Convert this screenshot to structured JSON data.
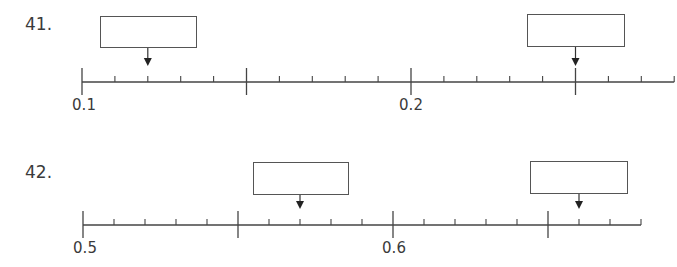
{
  "problems": [
    {
      "number": "41.",
      "line": {
        "start_value": 0.1,
        "end_value": 0.28,
        "minor_step": 0.01,
        "x_start": 82,
        "px_per_step": 32.9,
        "y": 82
      },
      "labels": [
        {
          "text": "0.1",
          "value": 0.1
        },
        {
          "text": "0.2",
          "value": 0.2
        }
      ],
      "answer_boxes": [
        {
          "points_to_value": 0.12,
          "value": ""
        },
        {
          "points_to_value": 0.25,
          "value": ""
        }
      ]
    },
    {
      "number": "42.",
      "line": {
        "start_value": 0.5,
        "end_value": 0.68,
        "minor_step": 0.01,
        "x_start": 83,
        "px_per_step": 31.0,
        "y": 225
      },
      "labels": [
        {
          "text": "0.5",
          "value": 0.5
        },
        {
          "text": "0.6",
          "value": 0.6
        }
      ],
      "answer_boxes": [
        {
          "points_to_value": 0.57,
          "value": ""
        },
        {
          "points_to_value": 0.66,
          "value": ""
        }
      ]
    }
  ],
  "chart_data": [
    {
      "type": "number_line",
      "title": "41.",
      "range": [
        0.1,
        0.28
      ],
      "minor_tick_step": 0.01,
      "major_ticks": [
        0.1,
        0.15,
        0.2,
        0.25
      ],
      "tick_labels": [
        "0.1",
        "0.2"
      ],
      "arrow_targets": [
        0.12,
        0.25
      ]
    },
    {
      "type": "number_line",
      "title": "42.",
      "range": [
        0.5,
        0.68
      ],
      "minor_tick_step": 0.01,
      "major_ticks": [
        0.5,
        0.55,
        0.6,
        0.65
      ],
      "tick_labels": [
        "0.5",
        "0.6"
      ],
      "arrow_targets": [
        0.57,
        0.66
      ]
    }
  ]
}
